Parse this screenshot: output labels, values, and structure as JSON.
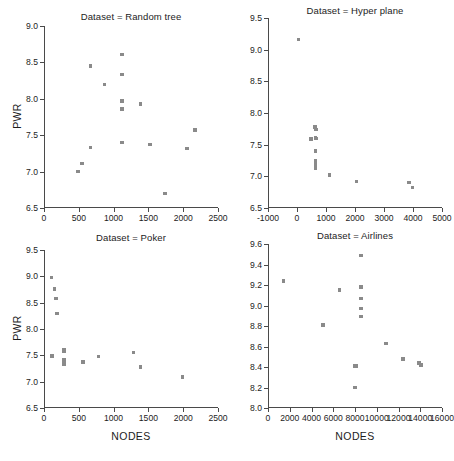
{
  "figure": {
    "width": 451,
    "height": 461,
    "point_color": "#8a8a8a",
    "axis_color": "#4a4a4a",
    "background": "#ffffff"
  },
  "chart_data": [
    {
      "type": "scatter",
      "title": "Dataset = Random tree",
      "xlabel": "",
      "ylabel": "PWR",
      "xlim": [
        0,
        2500
      ],
      "ylim": [
        6.5,
        9.0
      ],
      "xticks": [
        0,
        500,
        1000,
        1500,
        2000,
        2500
      ],
      "yticks": [
        6.5,
        7.0,
        7.5,
        8.0,
        8.5,
        9.0
      ],
      "xticklabels": [
        "0",
        "500",
        "1000",
        "1500",
        "2000",
        "2500"
      ],
      "yticklabels": [
        "6.5",
        "7.0",
        "7.5",
        "8.0",
        "8.5",
        "9.0"
      ],
      "grid": false,
      "legend": "none",
      "x": [
        487,
        545,
        672,
        672,
        872,
        1120,
        1120,
        1120,
        1120,
        1120,
        1120,
        1390,
        1525,
        1740,
        2055,
        2170
      ],
      "y": [
        7.0,
        7.11,
        8.45,
        7.33,
        8.2,
        8.61,
        8.33,
        7.97,
        7.86,
        7.4,
        7.4,
        7.93,
        7.37,
        6.7,
        7.32,
        7.57
      ]
    },
    {
      "type": "scatter",
      "title": "Dataset = Hyper plane",
      "xlabel": "",
      "ylabel": "",
      "xlim": [
        -1000,
        5000
      ],
      "ylim": [
        6.5,
        9.5
      ],
      "xticks": [
        -1000,
        0,
        1000,
        2000,
        3000,
        4000,
        5000
      ],
      "yticks": [
        6.5,
        7.0,
        7.5,
        8.0,
        8.5,
        9.0,
        9.5
      ],
      "xticklabels": [
        "-1000",
        "0",
        "1000",
        "2000",
        "3000",
        "4000",
        "5000"
      ],
      "yticklabels": [
        "6.5",
        "7.0",
        "7.5",
        "8.0",
        "8.5",
        "9.0",
        "9.5"
      ],
      "grid": false,
      "legend": "none",
      "x": [
        60,
        620,
        660,
        480,
        640,
        660,
        640,
        640,
        640,
        640,
        640,
        640,
        1130,
        2050,
        3860,
        3980
      ],
      "y": [
        9.16,
        7.78,
        7.74,
        7.59,
        7.61,
        7.6,
        7.4,
        7.25,
        7.22,
        7.19,
        7.16,
        7.13,
        7.02,
        6.92,
        6.9,
        6.82
      ]
    },
    {
      "type": "scatter",
      "title": "Dataset = Poker",
      "xlabel": "NODES",
      "ylabel": "PWR",
      "xlim": [
        0,
        2500
      ],
      "ylim": [
        6.5,
        9.5
      ],
      "xticks": [
        0,
        500,
        1000,
        1500,
        2000,
        2500
      ],
      "yticks": [
        6.5,
        7.0,
        7.5,
        8.0,
        8.5,
        9.0,
        9.5
      ],
      "xticklabels": [
        "0",
        "500",
        "1000",
        "1500",
        "2000",
        "2500"
      ],
      "yticklabels": [
        "6.5",
        "7.0",
        "7.5",
        "8.0",
        "8.5",
        "9.0",
        "9.5"
      ],
      "grid": false,
      "legend": "none",
      "x": [
        110,
        150,
        175,
        185,
        115,
        290,
        290,
        290,
        290,
        290,
        560,
        780,
        1285,
        1390,
        1990
      ],
      "y": [
        8.98,
        8.76,
        8.58,
        8.3,
        7.49,
        7.6,
        7.57,
        7.41,
        7.37,
        7.33,
        7.37,
        7.48,
        7.55,
        7.28,
        7.09
      ]
    },
    {
      "type": "scatter",
      "title": "Dataset = Airlines",
      "xlabel": "NODES",
      "ylabel": "",
      "xlim": [
        0,
        16000
      ],
      "ylim": [
        8.0,
        9.6
      ],
      "xticks": [
        0,
        2000,
        4000,
        6000,
        8000,
        10000,
        12000,
        14000,
        16000
      ],
      "yticks": [
        8.0,
        8.2,
        8.4,
        8.6,
        8.8,
        9.0,
        9.2,
        9.4,
        9.6
      ],
      "xticklabels": [
        "0",
        "2000",
        "4000",
        "6000",
        "8000",
        "10000",
        "12000",
        "14000",
        "16000"
      ],
      "yticklabels": [
        "8.0",
        "8.2",
        "8.4",
        "8.6",
        "8.8",
        "9.0",
        "9.2",
        "9.4",
        "9.6"
      ],
      "grid": false,
      "legend": "none",
      "x": [
        1400,
        5050,
        6550,
        8550,
        8550,
        8550,
        8550,
        8550,
        7980,
        8130,
        10850,
        12400,
        13900,
        14060,
        8000
      ],
      "y": [
        9.24,
        8.81,
        9.15,
        9.49,
        9.18,
        9.07,
        8.97,
        8.89,
        8.41,
        8.41,
        8.63,
        8.48,
        8.44,
        8.42,
        8.2
      ]
    }
  ]
}
